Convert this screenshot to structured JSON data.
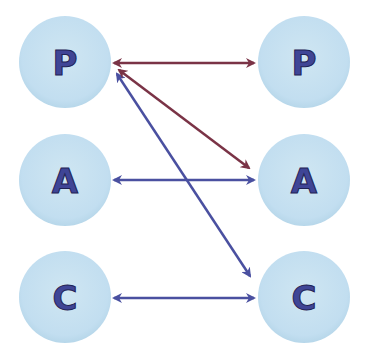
{
  "diagram": {
    "colors": {
      "node_fill": "#c4e0ee",
      "node_edge": "#b3d6e8",
      "label": "#3f4596",
      "label_shadow": "#1f2355",
      "maroon_arrow": "#7a3346",
      "blue_arrow": "#4a50a0"
    },
    "left_nodes": [
      {
        "id": "left-p",
        "label": "P",
        "cx": 65,
        "cy": 62
      },
      {
        "id": "left-a",
        "label": "A",
        "cx": 65,
        "cy": 180
      },
      {
        "id": "left-c",
        "label": "C",
        "cx": 65,
        "cy": 297
      }
    ],
    "right_nodes": [
      {
        "id": "right-p",
        "label": "P",
        "cx": 304,
        "cy": 62
      },
      {
        "id": "right-a",
        "label": "A",
        "cx": 304,
        "cy": 180
      },
      {
        "id": "right-c",
        "label": "C",
        "cx": 304,
        "cy": 297
      }
    ],
    "edges": [
      {
        "from": "left-p",
        "to": "right-p",
        "color": "maroon",
        "bidirectional": true
      },
      {
        "from": "left-p",
        "to": "right-a",
        "color": "maroon",
        "bidirectional": true
      },
      {
        "from": "left-a",
        "to": "right-a",
        "color": "blue",
        "bidirectional": true
      },
      {
        "from": "left-p",
        "to": "right-c",
        "color": "blue",
        "bidirectional": true
      },
      {
        "from": "left-c",
        "to": "right-c",
        "color": "blue",
        "bidirectional": true
      }
    ]
  }
}
